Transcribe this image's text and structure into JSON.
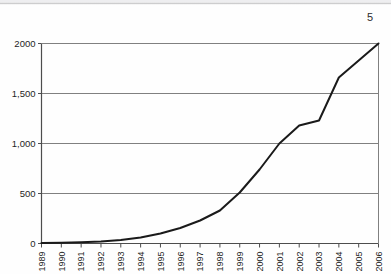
{
  "page": {
    "number": "5"
  },
  "chart_data": {
    "type": "line",
    "title": "",
    "subtitle": "",
    "xlabel": "",
    "ylabel": "",
    "categories": [
      "1989",
      "1990",
      "1991",
      "1992",
      "1993",
      "1994",
      "1995",
      "1996",
      "1997",
      "1998",
      "1999",
      "2000",
      "2001",
      "2002",
      "2003",
      "2004",
      "2005",
      "2006"
    ],
    "values": [
      5,
      8,
      12,
      20,
      35,
      60,
      100,
      155,
      230,
      330,
      510,
      740,
      1000,
      1180,
      1230,
      1660,
      1830,
      2000
    ],
    "series": [
      {
        "name": "",
        "values": [
          5,
          8,
          12,
          20,
          35,
          60,
          100,
          155,
          230,
          330,
          510,
          740,
          1000,
          1180,
          1230,
          1660,
          1830,
          2000
        ]
      }
    ],
    "ylim": [
      0,
      2000
    ],
    "ytick_values": [
      0,
      500,
      1000,
      1500,
      2000
    ],
    "ytick_labels": [
      "0",
      "500",
      "1,000",
      "1,500",
      "2000"
    ],
    "xtick_labels": [
      "1989",
      "1990",
      "1991",
      "1992",
      "1993",
      "1994",
      "1995",
      "1996",
      "1997",
      "1998",
      "1999",
      "2000",
      "2001",
      "2002",
      "2003",
      "2004",
      "2005",
      "2006"
    ],
    "grid": "horizontal",
    "legend": "none",
    "line_color": "#1a1a1a",
    "grid_color": "#808080",
    "axis_color": "#4d4d4d"
  }
}
